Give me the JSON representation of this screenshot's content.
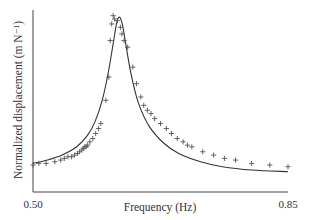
{
  "chart_data": {
    "type": "line",
    "title": "",
    "xlabel": "Frequency (Hz)",
    "ylabel": "Normalized displacement (m N⁻¹)",
    "xlim": [
      0.5,
      0.85
    ],
    "x_ticks": [
      "0.50",
      "0.85"
    ],
    "y_ticks": [],
    "grid": false,
    "legend": null,
    "series": [
      {
        "name": "Model (solid line)",
        "style": "line",
        "color": "#333333",
        "x": [
          0.5,
          0.52,
          0.54,
          0.56,
          0.575,
          0.585,
          0.595,
          0.603,
          0.61,
          0.615,
          0.619,
          0.623,
          0.628,
          0.635,
          0.645,
          0.66,
          0.68,
          0.7,
          0.73,
          0.76,
          0.8,
          0.85
        ],
        "y": [
          0.1,
          0.12,
          0.15,
          0.2,
          0.27,
          0.35,
          0.48,
          0.64,
          0.82,
          0.95,
          0.98,
          0.93,
          0.8,
          0.63,
          0.46,
          0.32,
          0.22,
          0.16,
          0.11,
          0.08,
          0.06,
          0.05
        ]
      },
      {
        "name": "Measured (+ markers)",
        "style": "marker",
        "marker": "+",
        "color": "#555555",
        "x": [
          0.5,
          0.508,
          0.518,
          0.53,
          0.538,
          0.543,
          0.548,
          0.553,
          0.557,
          0.561,
          0.564,
          0.567,
          0.569,
          0.571,
          0.573,
          0.575,
          0.578,
          0.582,
          0.586,
          0.59,
          0.593,
          0.6,
          0.604,
          0.606,
          0.608,
          0.61,
          0.612,
          0.616,
          0.62,
          0.622,
          0.625,
          0.63,
          0.637,
          0.642,
          0.648,
          0.652,
          0.657,
          0.662,
          0.667,
          0.675,
          0.683,
          0.69,
          0.698,
          0.706,
          0.712,
          0.718,
          0.733,
          0.748,
          0.763,
          0.778,
          0.8,
          0.825,
          0.85
        ],
        "y": [
          0.09,
          0.1,
          0.1,
          0.11,
          0.12,
          0.13,
          0.14,
          0.14,
          0.15,
          0.16,
          0.17,
          0.18,
          0.19,
          0.2,
          0.2,
          0.21,
          0.23,
          0.25,
          0.28,
          0.31,
          0.34,
          0.48,
          0.62,
          0.84,
          0.94,
          0.99,
          0.97,
          0.96,
          0.92,
          0.88,
          0.84,
          0.8,
          0.68,
          0.58,
          0.5,
          0.45,
          0.42,
          0.4,
          0.37,
          0.34,
          0.31,
          0.28,
          0.25,
          0.23,
          0.21,
          0.2,
          0.17,
          0.15,
          0.13,
          0.12,
          0.1,
          0.09,
          0.08
        ]
      }
    ]
  },
  "axes": {
    "x_label": "Frequency (Hz)",
    "y_label": "Normalized displacement (m N⁻¹)",
    "x_tick_min": "0.50",
    "x_tick_max": "0.85"
  }
}
